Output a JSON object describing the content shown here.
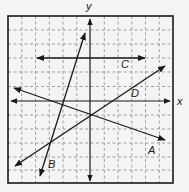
{
  "diagram": {
    "type": "coordinate-plane-with-lines",
    "axes": {
      "x_label": "x",
      "y_label": "y"
    },
    "grid": {
      "style": "dashed",
      "columns": 12,
      "rows": 12
    },
    "lines": [
      {
        "name": "A",
        "label": "A",
        "description": "negative slope, passes near origin"
      },
      {
        "name": "B",
        "label": "B",
        "description": "steep positive slope, crosses left of y-axis"
      },
      {
        "name": "C",
        "label": "C",
        "description": "horizontal line above x-axis"
      },
      {
        "name": "D",
        "label": "D",
        "description": "positive slope, passes through origin"
      }
    ],
    "colors": {
      "ink": "#1a1a1a",
      "grid": "#8a8a8a",
      "background": "#f4f4f2"
    }
  }
}
